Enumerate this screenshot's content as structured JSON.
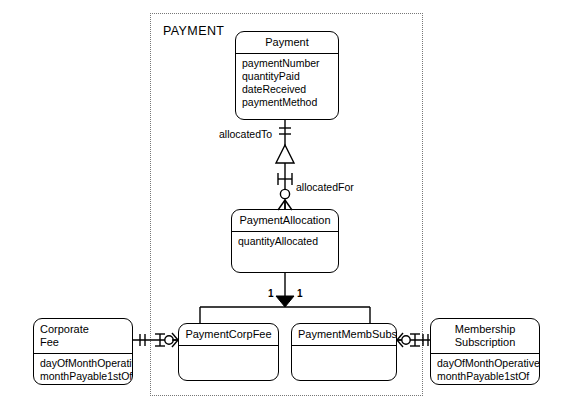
{
  "diagram": {
    "type": "entity-relationship-diagram",
    "notation": "crow's-foot / UML subtype",
    "subject_area": {
      "label": "PAYMENT",
      "style": "dotted-boundary"
    }
  },
  "entities": {
    "payment": {
      "name": "Payment",
      "attributes": [
        "paymentNumber",
        "quantityPaid",
        "dateReceived",
        "paymentMethod"
      ]
    },
    "payment_allocation": {
      "name": "PaymentAllocation",
      "attributes": [
        "quantityAllocated"
      ]
    },
    "payment_corp_fee": {
      "name": "PaymentCorpFee",
      "attributes": []
    },
    "payment_memb_subs": {
      "name": "PaymentMembSubs",
      "attributes": []
    },
    "corporate_fee": {
      "name": "Corporate\nFee",
      "attributes": [
        "dayOfMonthOperative",
        "monthPayable1stOf"
      ]
    },
    "membership_subscription": {
      "name": "Membership\nSubscription",
      "attributes": [
        "dayOfMonthOperative",
        "monthPayable1stOf"
      ]
    }
  },
  "relationships": {
    "allocated_to": {
      "label": "allocatedTo",
      "from": "PaymentAllocation",
      "to": "Payment"
    },
    "allocated_for": {
      "label": "allocatedFor",
      "from": "Payment",
      "to": "PaymentAllocation"
    },
    "subtype_corp": {
      "cardinality": "1"
    },
    "subtype_memb": {
      "cardinality": "1"
    }
  },
  "colors": {
    "line": "#000000",
    "boundary": "#777777",
    "background": "#ffffff"
  }
}
